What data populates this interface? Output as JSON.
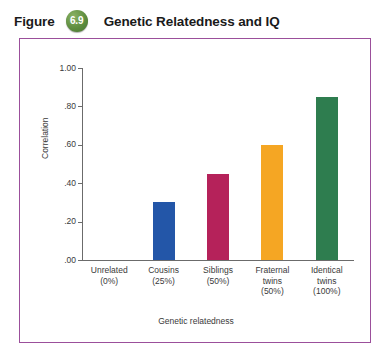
{
  "figure": {
    "label_word": "Figure",
    "number": "6.9",
    "title": "Genetic Relatedness and IQ",
    "badge_color": "#5c8c3e",
    "frame_color": "#9b4f9b"
  },
  "chart_data": {
    "type": "bar",
    "title": "Genetic Relatedness and IQ",
    "xlabel": "Genetic relatedness",
    "ylabel": "Correlation",
    "ylim": [
      0,
      1.0
    ],
    "yticks": [
      0.0,
      0.2,
      0.4,
      0.6,
      0.8,
      1.0
    ],
    "ytick_labels": [
      ".00",
      ".20",
      ".40",
      ".60",
      ".80",
      "1.00"
    ],
    "grid": false,
    "legend": "none",
    "categories": [
      "Unrelated\n(0%)",
      "Cousins\n(25%)",
      "Siblings\n(50%)",
      "Fraternal\ntwins\n(50%)",
      "Identical\ntwins\n(100%)"
    ],
    "values": [
      0.0,
      0.3,
      0.45,
      0.6,
      0.85
    ],
    "colors": [
      "#ffffff",
      "#2356a8",
      "#b5225a",
      "#f5a623",
      "#2e7d4f"
    ],
    "bars": [
      {
        "name": "Unrelated",
        "relatedness": "(0%)",
        "value": 0.0,
        "color": "#ffffff"
      },
      {
        "name": "Cousins",
        "relatedness": "(25%)",
        "value": 0.3,
        "color": "#2356a8"
      },
      {
        "name": "Siblings",
        "relatedness": "(50%)",
        "value": 0.45,
        "color": "#b5225a"
      },
      {
        "name": "Fraternal twins",
        "relatedness": "(50%)",
        "value": 0.6,
        "color": "#f5a623"
      },
      {
        "name": "Identical twins",
        "relatedness": "(100%)",
        "value": 0.85,
        "color": "#2e7d4f"
      }
    ],
    "xtick_lines": [
      [
        "Unrelated",
        "(0%)"
      ],
      [
        "Cousins",
        "(25%)"
      ],
      [
        "Siblings",
        "(50%)"
      ],
      [
        "Fraternal",
        "twins",
        "(50%)"
      ],
      [
        "Identical",
        "twins",
        "(100%)"
      ]
    ]
  }
}
